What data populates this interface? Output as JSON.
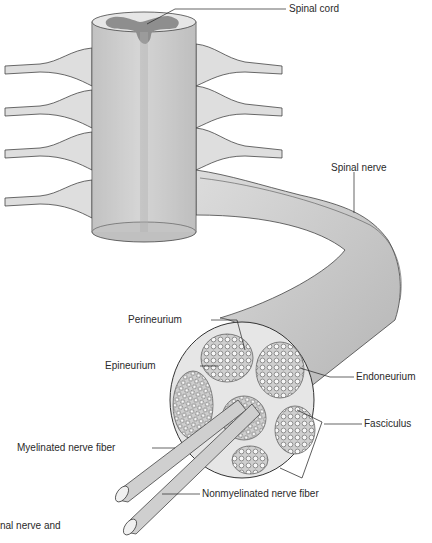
{
  "diagram": {
    "type": "anatomical-illustration",
    "labels": {
      "spinal_cord": "Spinal cord",
      "spinal_nerve": "Spinal nerve",
      "perineurium": "Perineurium",
      "epineurium": "Epineurium",
      "endoneurium": "Endoneurium",
      "fasciculus": "Fasciculus",
      "myelinated": "Myelinated nerve fiber",
      "nonmyelinated": "Nonmyelinated nerve fiber"
    },
    "caption_fragment": "nal nerve and"
  },
  "colors": {
    "tissue_light": "#e4e4e4",
    "tissue_mid": "#c8c8c8",
    "gray_matter": "#8e8e8e",
    "outline": "#333333",
    "leader_line": "#222222",
    "text": "#2a2a2a"
  }
}
